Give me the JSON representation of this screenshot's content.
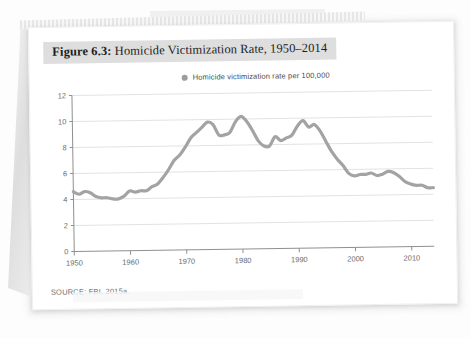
{
  "figure": {
    "number_label": "Figure 6.3:",
    "title_text": " Homicide Victimization Rate, 1950–2014",
    "full_title": "Figure 6.3: Homicide Victimization Rate, 1950–2014",
    "source": "SOURCE: FBI, 2015a.",
    "title_band_color": "#dedede"
  },
  "legend": {
    "marker_color": "#9d9d9d",
    "label": "Homicide victimization rate per 100,000"
  },
  "axes": {
    "y_ticks": [
      "0",
      "2",
      "4",
      "6",
      "8",
      "10",
      "12"
    ],
    "x_ticks": [
      "1950",
      "1960",
      "1970",
      "1980",
      "1990",
      "2000",
      "2010"
    ]
  },
  "chart_data": {
    "type": "line",
    "title": "Figure 6.3: Homicide Victimization Rate, 1950–2014",
    "xlabel": "",
    "ylabel": "",
    "xlim": [
      1950,
      2014
    ],
    "ylim": [
      0,
      12
    ],
    "y_ticks": [
      0,
      2,
      4,
      6,
      8,
      10,
      12
    ],
    "x_ticks": [
      1950,
      1960,
      1970,
      1980,
      1990,
      2000,
      2010
    ],
    "grid": "horizontal",
    "legend_position": "top-center",
    "line_color": "#a3a3a3",
    "line_width": 3.2,
    "series": [
      {
        "name": "Homicide victimization rate per 100,000",
        "x": [
          1950,
          1951,
          1952,
          1953,
          1954,
          1955,
          1956,
          1957,
          1958,
          1959,
          1960,
          1961,
          1962,
          1963,
          1964,
          1965,
          1966,
          1967,
          1968,
          1969,
          1970,
          1971,
          1972,
          1973,
          1974,
          1975,
          1976,
          1977,
          1978,
          1979,
          1980,
          1981,
          1982,
          1983,
          1984,
          1985,
          1986,
          1987,
          1988,
          1989,
          1990,
          1991,
          1992,
          1993,
          1994,
          1995,
          1996,
          1997,
          1998,
          1999,
          2000,
          2001,
          2002,
          2003,
          2004,
          2005,
          2006,
          2007,
          2008,
          2009,
          2010,
          2011,
          2012,
          2013,
          2014
        ],
        "values": [
          4.6,
          4.4,
          4.6,
          4.5,
          4.2,
          4.1,
          4.1,
          4.0,
          4.0,
          4.2,
          4.6,
          4.5,
          4.6,
          4.6,
          4.9,
          5.1,
          5.6,
          6.2,
          6.9,
          7.3,
          7.9,
          8.6,
          9.0,
          9.4,
          9.8,
          9.6,
          8.8,
          8.8,
          9.0,
          9.8,
          10.2,
          9.8,
          9.1,
          8.3,
          7.9,
          7.9,
          8.6,
          8.3,
          8.5,
          8.7,
          9.4,
          9.8,
          9.3,
          9.5,
          9.0,
          8.2,
          7.4,
          6.8,
          6.3,
          5.7,
          5.5,
          5.6,
          5.6,
          5.7,
          5.5,
          5.6,
          5.8,
          5.7,
          5.4,
          5.0,
          4.8,
          4.7,
          4.7,
          4.5,
          4.5
        ]
      }
    ]
  }
}
